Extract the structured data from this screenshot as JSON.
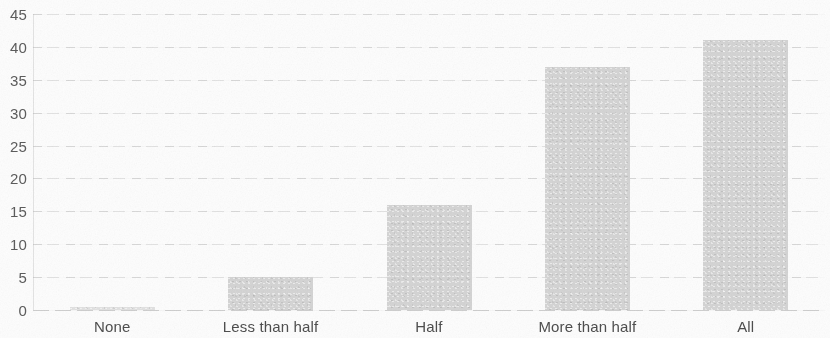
{
  "chart_data": {
    "type": "bar",
    "title": "",
    "subtitle": "",
    "xlabel": "",
    "ylabel": "",
    "categories": [
      "None",
      "Less than half",
      "Half",
      "More than half",
      "All"
    ],
    "values": [
      0.5,
      5,
      16,
      37,
      41
    ],
    "series": [
      {
        "name": "",
        "values": [
          0.5,
          5,
          16,
          37,
          41
        ]
      }
    ],
    "ylim": [
      0,
      45
    ],
    "y_ticks": [
      0,
      5,
      10,
      15,
      20,
      25,
      30,
      35,
      40,
      45
    ],
    "y_tick_labels": [
      "0",
      "5",
      "10",
      "15",
      "20",
      "25",
      "30",
      "35",
      "40",
      "45"
    ],
    "grid": true,
    "grid_axis": "y",
    "legend": false,
    "legend_position": "none",
    "bar_color": "#d5d5d5",
    "axis_label_color": "#4f4f4f",
    "tick_label_color": "#5d5d5d",
    "gridline_color": "#c8c8c8",
    "background_color": "#fdfdfd"
  }
}
